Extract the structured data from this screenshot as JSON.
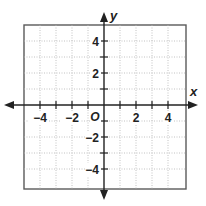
{
  "diagram": {
    "type": "coordinate-plane",
    "x_axis": {
      "label": "x",
      "min": -5,
      "max": 5,
      "tick_step": 1,
      "labeled_ticks": [
        -4,
        -2,
        2,
        4
      ]
    },
    "y_axis": {
      "label": "y",
      "min": -5,
      "max": 5,
      "tick_step": 1,
      "labeled_ticks": [
        -4,
        -2,
        2,
        4
      ]
    },
    "origin_label": "O",
    "grid": {
      "style": "dotted",
      "color": "#b0b0b0"
    },
    "frame_color": "#555555",
    "axis_color": "#222222"
  },
  "labels": {
    "x_axis": "x",
    "y_axis": "y",
    "origin": "O",
    "x_ticks": [
      "−4",
      "−2",
      "2",
      "4"
    ],
    "y_ticks": [
      "4",
      "2",
      "−2",
      "−4"
    ]
  }
}
